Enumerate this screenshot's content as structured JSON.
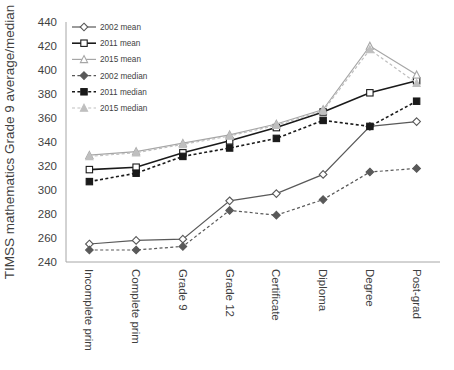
{
  "chart_data": {
    "type": "line",
    "title": "",
    "xlabel": "",
    "ylabel": "TIMSS mathematics Grade 9 average/median",
    "ylim": [
      240,
      440
    ],
    "ytick_step": 20,
    "yticks": [
      240,
      260,
      280,
      300,
      320,
      340,
      360,
      380,
      400,
      420,
      440
    ],
    "grid": false,
    "legend_position": "top-left",
    "categories": [
      "Incomplete prim",
      "Complete prim",
      "Grade 9",
      "Grade 12",
      "Certificate",
      "Diploma",
      "Degree",
      "Post-grad"
    ],
    "series": [
      {
        "name": "2002 mean",
        "values": [
          255,
          258,
          259,
          291,
          297,
          313,
          353,
          357
        ],
        "color": "#595959",
        "dash": "solid",
        "marker": "open-diamond"
      },
      {
        "name": "2011 mean",
        "values": [
          317,
          319,
          331,
          341,
          352,
          365,
          381,
          391
        ],
        "color": "#1a1a1a",
        "dash": "solid",
        "marker": "open-square"
      },
      {
        "name": "2015 mean",
        "values": [
          329,
          332,
          339,
          346,
          355,
          367,
          420,
          396
        ],
        "color": "#a6a6a6",
        "dash": "solid",
        "marker": "open-triangle"
      },
      {
        "name": "2002 median",
        "values": [
          250,
          250,
          253,
          283,
          279,
          292,
          315,
          318
        ],
        "color": "#595959",
        "dash": "dashed",
        "marker": "filled-diamond"
      },
      {
        "name": "2011 median",
        "values": [
          307,
          314,
          328,
          335,
          343,
          358,
          353,
          374
        ],
        "color": "#1a1a1a",
        "dash": "dashed",
        "marker": "filled-square"
      },
      {
        "name": "2015 median",
        "values": [
          328,
          331,
          338,
          345,
          354,
          366,
          417,
          389
        ],
        "color": "#bfbfbf",
        "dash": "dashed",
        "marker": "filled-triangle"
      }
    ]
  },
  "legend": {
    "entries": [
      "2002 mean",
      "2011 mean",
      "2015 mean",
      "2002 median",
      "2011 median",
      "2015 median"
    ]
  }
}
